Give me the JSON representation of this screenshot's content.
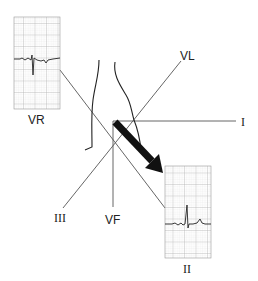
{
  "diagram": {
    "leads": [
      {
        "id": "VR",
        "label": "VR"
      },
      {
        "id": "VL",
        "label": "VL"
      },
      {
        "id": "I",
        "label": "I"
      },
      {
        "id": "III",
        "label": "III"
      },
      {
        "id": "VF",
        "label": "VF"
      },
      {
        "id": "II",
        "label": "II"
      }
    ],
    "strips": [
      {
        "lead": "VR",
        "label": "VR",
        "deflection": "negative"
      },
      {
        "lead": "II",
        "label": "II",
        "deflection": "positive"
      }
    ],
    "axis_arrow": {
      "direction": "toward lead II"
    },
    "colors": {
      "line": "#555555",
      "ink": "#111111",
      "grid": "#bdbdbd",
      "grid_fine": "#dddddd"
    }
  }
}
